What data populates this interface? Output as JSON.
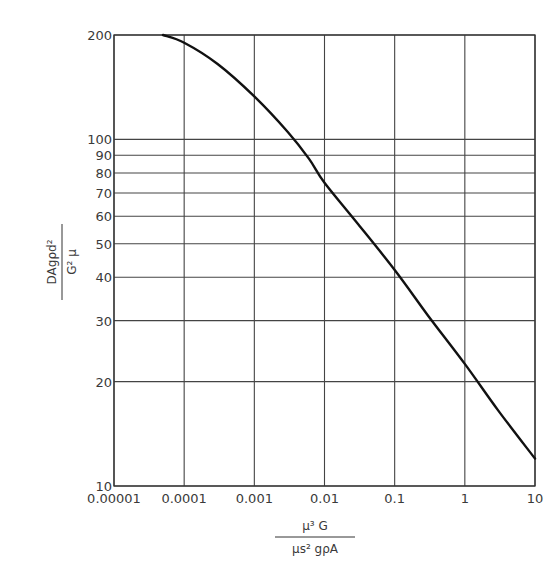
{
  "chart_data": {
    "type": "line",
    "title": "",
    "xlabel": {
      "numerator": "μ³ G",
      "denominator": "μs² gρA"
    },
    "ylabel": {
      "numerator": "DAgρd²",
      "denominator": "G² μ"
    },
    "xscale": "log",
    "yscale": "log",
    "xlim": [
      1e-05,
      10
    ],
    "ylim": [
      10,
      200
    ],
    "grid": true,
    "legend": null,
    "x_ticks": [
      "0.00001",
      "0.0001",
      "0.001",
      "0.01",
      "0.1",
      "1",
      "10"
    ],
    "x_tick_values": [
      1e-05,
      0.0001,
      0.001,
      0.01,
      0.1,
      1,
      10
    ],
    "y_ticks": [
      "10",
      "20",
      "30",
      "40",
      "50",
      "60",
      "70",
      "80",
      "90",
      "100",
      "200"
    ],
    "y_tick_values": [
      10,
      20,
      30,
      40,
      50,
      60,
      70,
      80,
      90,
      100,
      200
    ],
    "series": [
      {
        "name": "curve",
        "x": [
          5e-05,
          0.0001,
          0.0003,
          0.001,
          0.003,
          0.006,
          0.01,
          0.03,
          0.1,
          0.3,
          1,
          3,
          10
        ],
        "y": [
          200,
          190,
          165,
          133,
          105,
          88,
          75,
          57,
          42,
          31,
          22.5,
          16.5,
          12
        ]
      }
    ]
  }
}
